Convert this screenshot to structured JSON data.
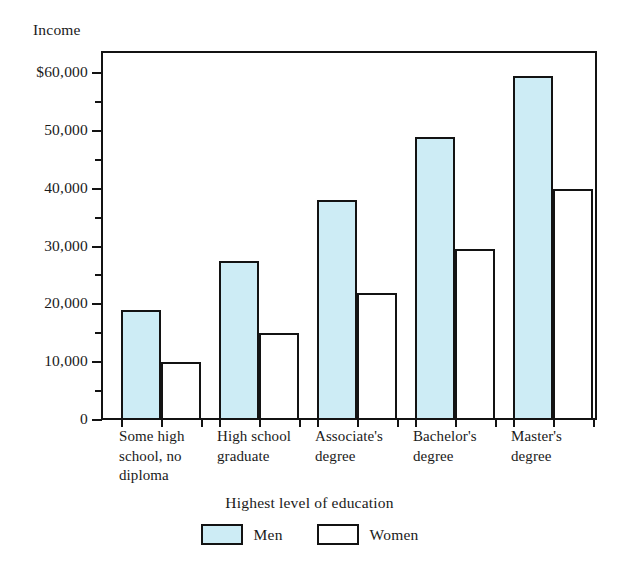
{
  "chart_data": {
    "type": "bar",
    "title": "",
    "ylabel": "Income",
    "xlabel": "Highest level of education",
    "categories": [
      "Some high school, no diploma",
      "High school graduate",
      "Associate's degree",
      "Bachelor's degree",
      "Master's degree"
    ],
    "category_lines": [
      [
        "Some high",
        "school, no",
        "diploma"
      ],
      [
        "High school",
        "graduate"
      ],
      [
        "Associate's",
        "degree"
      ],
      [
        "Bachelor's",
        "degree"
      ],
      [
        "Master's",
        "degree"
      ]
    ],
    "series": [
      {
        "name": "Men",
        "color": "#cdecf5",
        "values": [
          19000,
          27500,
          38000,
          49000,
          59500
        ]
      },
      {
        "name": "Women",
        "color": "#ffffff",
        "values": [
          10000,
          15000,
          22000,
          29500,
          40000
        ]
      }
    ],
    "ylim": [
      0,
      60000
    ],
    "ytick_values": [
      0,
      10000,
      20000,
      30000,
      40000,
      50000,
      60000
    ],
    "ytick_labels": [
      "0",
      "10,000",
      "20,000",
      "30,000",
      "40,000",
      "50,000",
      "$60,000"
    ],
    "yminor_tick_values": [
      5000,
      15000,
      25000,
      35000,
      45000,
      55000
    ],
    "grid": false,
    "legend_position": "bottom",
    "legend_entries": [
      "Men",
      "Women"
    ],
    "axis_color": "#131313",
    "bar_outline_color": "#131313"
  }
}
